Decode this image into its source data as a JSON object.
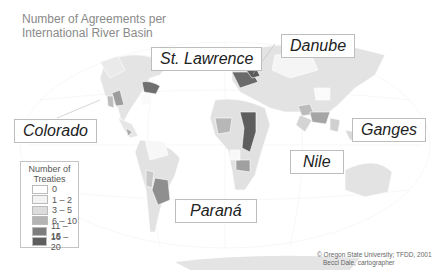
{
  "title": {
    "line1": "Number of Agreements per",
    "line2": "International River Basin"
  },
  "labels": {
    "st_lawrence": "St. Lawrence",
    "danube": "Danube",
    "colorado": "Colorado",
    "ganges": "Ganges",
    "nile": "Nile",
    "parana": "Paraná"
  },
  "legend": {
    "title_line1": "Number of",
    "title_line2": "Treaties",
    "classes": [
      {
        "label": "0",
        "color": "#ffffff"
      },
      {
        "label": "1 – 2",
        "color": "#f3f3f3"
      },
      {
        "label": "3 – 5",
        "color": "#dcdcdc"
      },
      {
        "label": "6 – 10",
        "color": "#b4b4b4"
      },
      {
        "label": "11 – 15",
        "color": "#7d7d7d"
      },
      {
        "label": "16 – 20",
        "color": "#5e5e5e"
      }
    ]
  },
  "credit": {
    "line1": "© Oregon State University; TFDD, 2001",
    "line2": "Becci Dale, cartographer"
  },
  "basins": [
    {
      "name": "Colorado",
      "class": "6 – 10"
    },
    {
      "name": "St. Lawrence",
      "class": "11 – 15"
    },
    {
      "name": "Danube",
      "class": "16 – 20"
    },
    {
      "name": "Nile",
      "class": "16 – 20"
    },
    {
      "name": "Ganges",
      "class": "6 – 10"
    },
    {
      "name": "Paraná",
      "class": "6 – 10"
    }
  ],
  "colors": {
    "land_base": "#e2e2e2",
    "land_light": "#efefef",
    "border": "#ffffff",
    "graticule": "#eeeeee"
  }
}
